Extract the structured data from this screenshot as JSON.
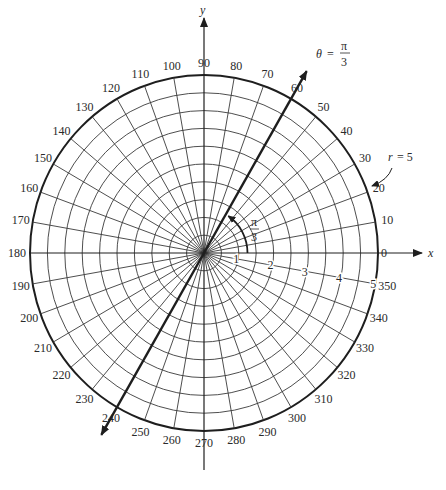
{
  "diagram": {
    "max_radius": 5,
    "ring_step": 0.5,
    "radial_step_degrees": 10,
    "axis_labels": {
      "x": "x",
      "y": "y"
    },
    "angle_labels": [
      "0",
      "10",
      "20",
      "30",
      "40",
      "50",
      "60",
      "70",
      "80",
      "90",
      "100",
      "110",
      "120",
      "130",
      "140",
      "150",
      "160",
      "170",
      "180",
      "190",
      "200",
      "210",
      "220",
      "230",
      "240",
      "250",
      "260",
      "270",
      "280",
      "290",
      "300",
      "310",
      "320",
      "330",
      "340",
      "350"
    ],
    "radius_labels": [
      "1",
      "2",
      "3",
      "4",
      "5"
    ],
    "highlighted_ray": {
      "angle_degrees": 60,
      "label_theta": "θ",
      "label_equals": "=",
      "label_num": "π",
      "label_den": "3"
    },
    "angle_arc": {
      "angle_degrees": 60,
      "label_num": "π",
      "label_den": "3"
    },
    "circle_annotation": {
      "label_r": "r",
      "label_rest": "= 5"
    }
  }
}
